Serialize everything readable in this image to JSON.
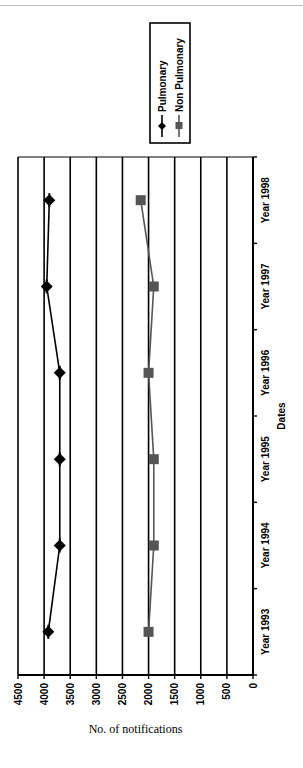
{
  "chart_data": {
    "type": "line",
    "title": "",
    "xlabel": "Dates",
    "ylabel": "No. of notifications",
    "categories": [
      "Year 1993",
      "Year 1994",
      "Year 1995",
      "Year 1996",
      "Year 1997",
      "Year 1998"
    ],
    "series": [
      {
        "name": "Pulmonary",
        "marker": "diamond",
        "color": "#000000",
        "values": [
          3920,
          3700,
          3700,
          3700,
          3950,
          3900
        ]
      },
      {
        "name": "Non Pulmonary",
        "marker": "square",
        "color": "#555555",
        "values": [
          2000,
          1900,
          1900,
          2000,
          1900,
          2150
        ]
      }
    ],
    "yticks": [
      0,
      500,
      1000,
      1500,
      2000,
      2500,
      3000,
      3500,
      4000,
      4500
    ],
    "ylim": [
      0,
      4500
    ],
    "grid": true,
    "legend_position": "right",
    "rotation": "-90deg"
  }
}
